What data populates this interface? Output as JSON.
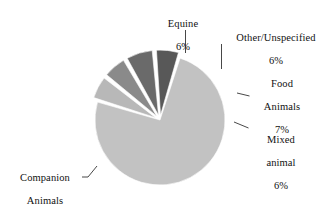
{
  "chart_data": {
    "type": "pie",
    "title": "",
    "subtitle": "",
    "xlabel": "",
    "ylabel": "",
    "legend_position": "none",
    "grid": false,
    "units": "percent",
    "categories": [
      "Companion Animals",
      "Equine",
      "Other/Unspecified",
      "Food Animals",
      "Mixed animal"
    ],
    "values": [
      75,
      6,
      6,
      7,
      6
    ],
    "slices": [
      {
        "id": "companion",
        "name": "Companion Animals",
        "name_line1": "Companion",
        "name_line2": "Animals",
        "percent_label": "75%",
        "value": 75,
        "color": "#c2c2c2",
        "exploded": false
      },
      {
        "id": "equine",
        "name": "Equine",
        "name_line1": "Equine",
        "name_line2": "",
        "percent_label": "6%",
        "value": 6,
        "color": "#b8b8b8",
        "exploded": true
      },
      {
        "id": "other",
        "name": "Other/Unspecified",
        "name_line1": "Other/Unspecified",
        "name_line2": "",
        "percent_label": "6%",
        "value": 6,
        "color": "#8a8a8a",
        "exploded": true
      },
      {
        "id": "food",
        "name": "Food Animals",
        "name_line1": "Food",
        "name_line2": "Animals",
        "percent_label": "7%",
        "value": 7,
        "color": "#6a6a6a",
        "exploded": true
      },
      {
        "id": "mixed",
        "name": "Mixed animal",
        "name_line1": "Mixed",
        "name_line2": "animal",
        "percent_label": "6%",
        "value": 6,
        "color": "#585858",
        "exploded": true
      }
    ],
    "background_color": "#ffffff",
    "separator_color": "#ffffff",
    "leader_line_color": "#333333"
  },
  "labels": {
    "equine": {
      "line1": "Equine",
      "pct": "6%"
    },
    "other": {
      "line1": "Other/Unspecified",
      "pct": "6%"
    },
    "food": {
      "line1": "Food",
      "line2": "Animals",
      "pct": "7%"
    },
    "mixed": {
      "line1": "Mixed",
      "line2": "animal",
      "pct": "6%"
    },
    "companion": {
      "line1": "Companion",
      "line2": "Animals",
      "pct": "75%"
    }
  }
}
